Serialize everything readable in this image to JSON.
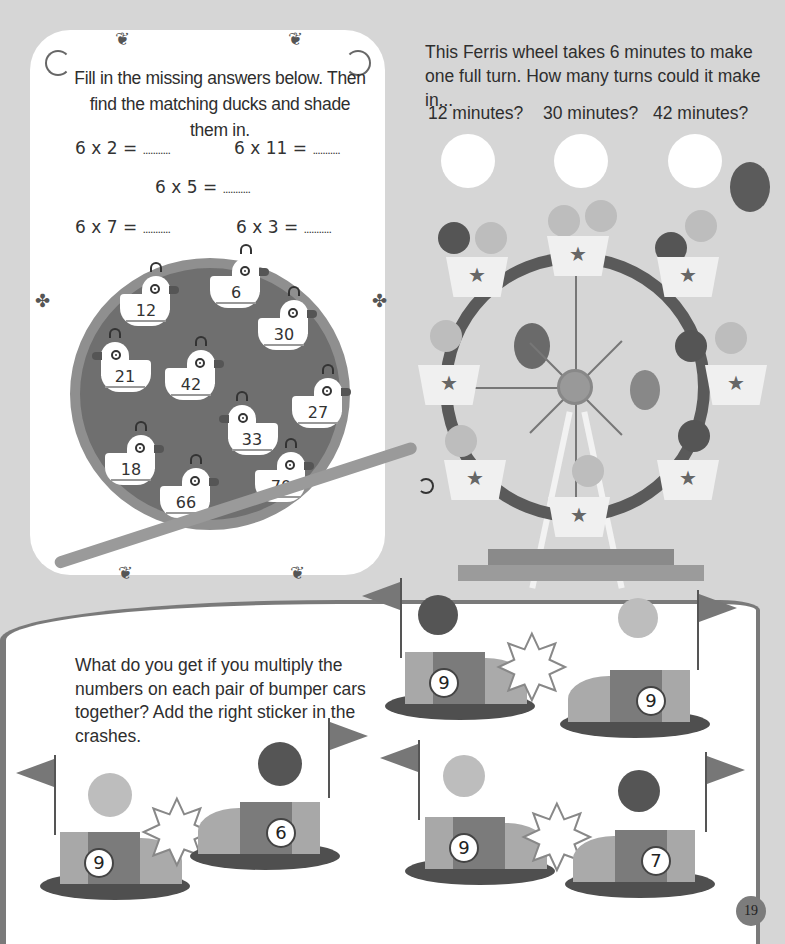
{
  "page": {
    "number": "19",
    "background": "#d6d6d6"
  },
  "duck_section": {
    "instruction": "Fill in the missing answers below. Then find the matching ducks and shade them in.",
    "equations": [
      {
        "text": "6 x 2 =",
        "blank": "..........."
      },
      {
        "text": "6 x 11 =",
        "blank": "..........."
      },
      {
        "text": "6 x 5 =",
        "blank": "..........."
      },
      {
        "text": "6 x 7 =",
        "blank": "..........."
      },
      {
        "text": "6 x 3 =",
        "blank": "..........."
      }
    ],
    "ducks": [
      "12",
      "6",
      "30",
      "21",
      "42",
      "27",
      "33",
      "18",
      "66",
      "70"
    ]
  },
  "ferris_section": {
    "question": "This Ferris wheel takes 6 minutes to make one full turn. How many turns could it make in...",
    "prompts": [
      "12 minutes?",
      "30 minutes?",
      "42 minutes?"
    ]
  },
  "bumper_section": {
    "question": "What do you get if you multiply the numbers on each pair of bumper cars together? Add the right sticker in the crashes.",
    "cars": [
      {
        "number": "9",
        "icon": "lightning-icon"
      },
      {
        "number": "9",
        "icon": "planet-icon"
      },
      {
        "number": "9",
        "icon": "star-icon"
      },
      {
        "number": "6",
        "icon": "planet-icon"
      },
      {
        "number": "9",
        "icon": "star-icon"
      },
      {
        "number": "7",
        "icon": "lightning-icon"
      }
    ],
    "star_glyph": "★",
    "crash_glyph": "✸"
  }
}
